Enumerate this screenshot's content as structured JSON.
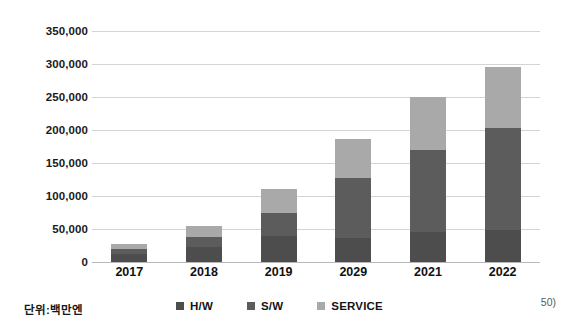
{
  "chart_data": {
    "type": "bar",
    "stacked": true,
    "title": "",
    "subtitle": "",
    "xlabel": "",
    "ylabel": "",
    "unit_note": "단위:백만엔",
    "footnote": "50)",
    "categories": [
      "2017",
      "2018",
      "2019",
      "2029",
      "2021",
      "2022"
    ],
    "series": [
      {
        "name": "H/W",
        "color": "#4d4d4d",
        "values": [
          12000,
          22000,
          40000,
          37000,
          45000,
          48000
        ]
      },
      {
        "name": "S/W",
        "color": "#5c5c5c",
        "values": [
          8000,
          16000,
          35000,
          91000,
          125000,
          155000
        ]
      },
      {
        "name": "SERVICE",
        "color": "#a9a9a9",
        "values": [
          7000,
          17000,
          35000,
          59000,
          80000,
          92000
        ]
      }
    ],
    "totals": [
      27000,
      55000,
      110000,
      187000,
      250000,
      295000
    ],
    "ylim": [
      0,
      350000
    ],
    "ytick_step": 50000,
    "ytick_labels": [
      "0",
      "50,000",
      "100,000",
      "150,000",
      "200,000",
      "250,000",
      "300,000",
      "350,000"
    ],
    "ytick_values": [
      0,
      50000,
      100000,
      150000,
      200000,
      250000,
      300000,
      350000
    ],
    "grid": true,
    "grid_color": "#d4d4d4",
    "legend_position": "bottom",
    "background": "#ffffff"
  }
}
